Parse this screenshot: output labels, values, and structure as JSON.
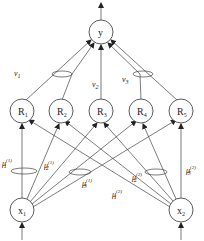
{
  "diagram": {
    "type": "network",
    "colors": {
      "stroke": "#444444",
      "background": "#ffffff"
    },
    "nodes": {
      "output": {
        "id": "y",
        "label": "y",
        "cx": 101,
        "cy": 32
      },
      "hidden": [
        {
          "id": "R1",
          "label": "R",
          "sub": "1",
          "cx": 22,
          "cy": 111
        },
        {
          "id": "R2",
          "label": "R",
          "sub": "2",
          "cx": 61,
          "cy": 111
        },
        {
          "id": "R3",
          "label": "R",
          "sub": "3",
          "cx": 101,
          "cy": 111
        },
        {
          "id": "R4",
          "label": "R",
          "sub": "4",
          "cx": 141,
          "cy": 111
        },
        {
          "id": "R5",
          "label": "R",
          "sub": "5",
          "cx": 181,
          "cy": 111
        }
      ],
      "inputs": [
        {
          "id": "x1",
          "label": "x",
          "sub": "1",
          "cx": 22,
          "cy": 210
        },
        {
          "id": "x2",
          "label": "x",
          "sub": "2",
          "cx": 181,
          "cy": 210
        }
      ]
    },
    "output_weights": [
      {
        "label": "ν",
        "sub": "1",
        "x": 14,
        "y": 76
      },
      {
        "label": "ν",
        "sub": "2",
        "x": 92,
        "y": 87
      },
      {
        "label": "ν",
        "sub": "3",
        "x": 122,
        "y": 82
      }
    ],
    "input_weights": [
      {
        "label": "μ",
        "sub": "1",
        "sup": "(1)",
        "x": 2,
        "y": 166
      },
      {
        "label": "μ",
        "sub": "2",
        "sup": "(1)",
        "x": 44,
        "y": 168
      },
      {
        "label": "μ",
        "sub": "3",
        "sup": "(1)",
        "x": 82,
        "y": 186
      },
      {
        "label": "μ",
        "sub": "1",
        "sup": "(2)",
        "x": 112,
        "y": 197
      },
      {
        "label": "μ",
        "sub": "2",
        "sup": "(2)",
        "x": 132,
        "y": 180
      },
      {
        "label": "μ",
        "sub": "3",
        "sup": "(2)",
        "x": 186,
        "y": 173
      }
    ]
  }
}
